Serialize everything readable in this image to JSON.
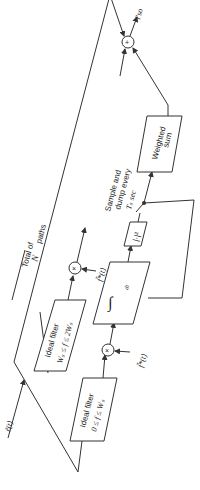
{
  "diagram": {
    "orientation": "rotated -90deg (reads bottom to top)",
    "input_label": "r̃(t)",
    "output_label": "l'so",
    "blocks": {
      "lowpass_filter": {
        "line1": "Ideal filter",
        "line2": "0 ≤ f ≤ Wₛ"
      },
      "bandpass_filter": {
        "line1": "Ideal filter",
        "line2": "Wₛ ≤ f ≤ 2Wₛ"
      },
      "integrator": {
        "symbol": "∫",
        "upper": "t",
        "lower": "t−Tₛ",
        "dt": "dt"
      },
      "magnitude_squared": {
        "label": "|·|²"
      },
      "weighted_sum": {
        "line1": "Weighted",
        "line2": "sum"
      }
    },
    "multipliers": [
      {
        "symbol": "×",
        "ref_label": "f̃*(t)"
      },
      {
        "symbol": "×",
        "ref_label": "f̃*(t)"
      }
    ],
    "summer": {
      "symbol": "+"
    },
    "annotations": {
      "paths_line1": "Total of",
      "paths_line2": "N",
      "paths_sub": "R",
      "paths_line3": "paths",
      "sample_line1": "Sample and",
      "sample_line2": "dump every",
      "sample_line3": "Tₛ sec"
    }
  }
}
